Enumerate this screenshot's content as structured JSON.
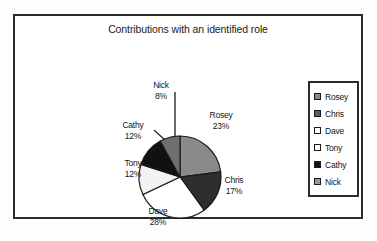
{
  "chart_data": {
    "type": "pie",
    "title": "Contributions with an identified role",
    "categories": [
      "Rosey",
      "Chris",
      "Dave",
      "Tony",
      "Cathy",
      "Nick"
    ],
    "values": [
      23,
      17,
      28,
      12,
      12,
      8
    ],
    "value_suffix": "%",
    "labels": [
      {
        "name": "Rosey",
        "percent": "23%",
        "color": "#8a8a8a"
      },
      {
        "name": "Chris",
        "percent": "17%",
        "color": "#2e2e2e"
      },
      {
        "name": "Dave",
        "percent": "28%",
        "color": "#ffffff"
      },
      {
        "name": "Tony",
        "percent": "12%",
        "color": "#f2f2f2"
      },
      {
        "name": "Cathy",
        "percent": "12%",
        "color": "#111111"
      },
      {
        "name": "Nick",
        "percent": "8%",
        "color": "#6f6f6f"
      }
    ],
    "legend_position": "right",
    "legend": [
      {
        "label": "Rosey",
        "color": "#8a8a8a"
      },
      {
        "label": "Chris",
        "color": "#5c5c5c"
      },
      {
        "label": "Dave",
        "color": "#ffffff"
      },
      {
        "label": "Tony",
        "color": "#fafafa"
      },
      {
        "label": "Cathy",
        "color": "#111111"
      },
      {
        "label": "Nick",
        "color": "#9a9a9a"
      }
    ],
    "start_angle": 0,
    "direction": "clockwise",
    "grid": false
  }
}
